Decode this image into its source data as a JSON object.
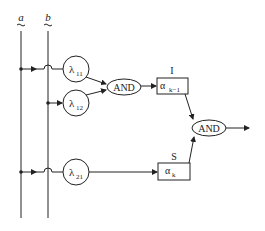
{
  "diagram": {
    "inputs": [
      {
        "id": "a",
        "label": "a"
      },
      {
        "id": "b",
        "label": "b"
      }
    ],
    "nodes": [
      {
        "id": "lambda11",
        "type": "circle",
        "symbol": "λ",
        "subscript": "11"
      },
      {
        "id": "lambda12",
        "type": "circle",
        "symbol": "λ",
        "subscript": "12"
      },
      {
        "id": "lambda21",
        "type": "circle",
        "symbol": "λ",
        "subscript": "21"
      },
      {
        "id": "and1",
        "type": "ellipse",
        "label": "AND"
      },
      {
        "id": "boxI",
        "type": "box",
        "symbol": "α",
        "subscript": "k−1",
        "title": "I"
      },
      {
        "id": "boxS",
        "type": "box",
        "symbol": "α",
        "subscript": "k",
        "title": "S"
      },
      {
        "id": "and2",
        "type": "ellipse",
        "label": "AND"
      }
    ],
    "edges": [
      {
        "from": "a",
        "to": "lambda11"
      },
      {
        "from": "b",
        "to": "lambda12"
      },
      {
        "from": "a",
        "to": "lambda21"
      },
      {
        "from": "lambda11",
        "to": "and1"
      },
      {
        "from": "lambda12",
        "to": "and1"
      },
      {
        "from": "and1",
        "to": "boxI"
      },
      {
        "from": "lambda21",
        "to": "boxS"
      },
      {
        "from": "boxI",
        "to": "and2"
      },
      {
        "from": "boxS",
        "to": "and2"
      },
      {
        "from": "and2",
        "to": "output"
      }
    ]
  }
}
